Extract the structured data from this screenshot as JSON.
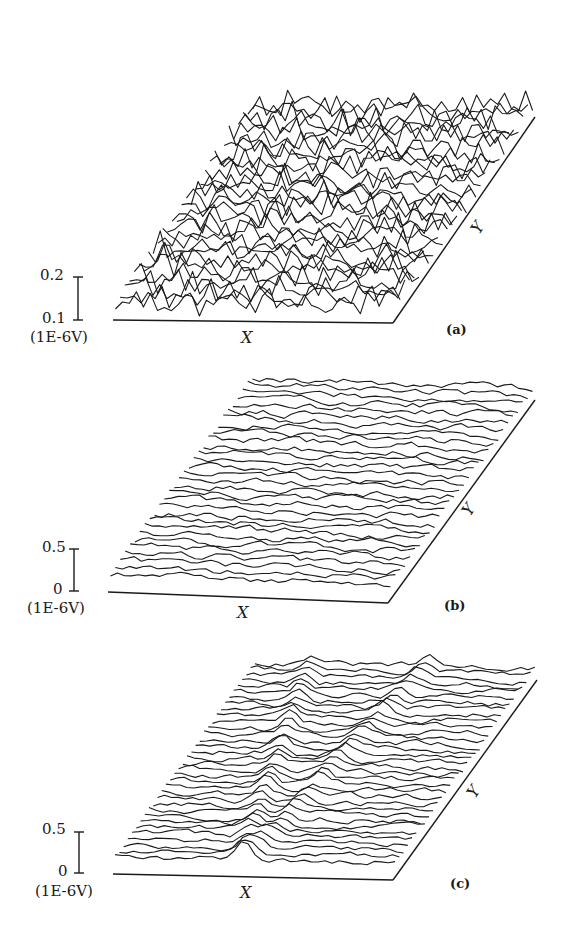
{
  "chart_data": [
    {
      "type": "surface-3d-waterfall",
      "panel": "(a)",
      "xlabel": "X",
      "ylabel": "Y",
      "zscale_bar": {
        "top_label": "0.2",
        "bottom_label": "0.1",
        "unit": "(1E-6V)"
      },
      "description": "Highly noisy, irregular surface with large random peaks across the whole X-Y plane",
      "traces": 30,
      "amplitude": 22,
      "roughness": "high",
      "seed": 7,
      "geometry": {
        "x0": 113,
        "y0": 320,
        "x1": 393,
        "y1": 323,
        "yx": 535,
        "yy": 117,
        "lift": 12
      }
    },
    {
      "type": "surface-3d-waterfall",
      "panel": "(b)",
      "xlabel": "X",
      "ylabel": "Y",
      "zscale_bar": {
        "top_label": "0.5",
        "bottom_label": "0",
        "unit": "(1E-6V)"
      },
      "description": "Low-amplitude smooth random surface; mostly flat with small ripples",
      "traces": 30,
      "amplitude": 6,
      "roughness": "low",
      "seed": 19,
      "geometry": {
        "x0": 108,
        "y0": 592,
        "x1": 388,
        "y1": 603,
        "yx": 535,
        "yy": 400,
        "lift": 12
      }
    },
    {
      "type": "surface-3d-waterfall",
      "panel": "(c)",
      "xlabel": "X",
      "ylabel": "Y",
      "zscale_bar": {
        "top_label": "0.5",
        "bottom_label": "0",
        "unit": "(1E-6V)"
      },
      "description": "Smooth surface with two distinct linear ridges running diagonally along Y",
      "traces": 34,
      "amplitude": 5,
      "roughness": "low",
      "ridges": [
        {
          "x_frac_start": 0.45,
          "x_frac_end": 0.2,
          "height": 10
        },
        {
          "x_frac_start": 0.47,
          "x_frac_end": 0.62,
          "height": 9
        }
      ],
      "seed": 31,
      "geometry": {
        "x0": 113,
        "y0": 874,
        "x1": 393,
        "y1": 880,
        "yx": 537,
        "yy": 680,
        "lift": 12
      }
    }
  ],
  "labels": {
    "a": {
      "z_top": "0.2",
      "z_bottom": "0.1",
      "unit": "(1E-6V)",
      "x": "X",
      "y": "Y",
      "id": "(a)"
    },
    "b": {
      "z_top": "0.5",
      "z_bottom": "0",
      "unit": "(1E-6V)",
      "x": "X",
      "y": "Y",
      "id": "(b)"
    },
    "c": {
      "z_top": "0.5",
      "z_bottom": "0",
      "unit": "(1E-6V)",
      "x": "X",
      "y": "Y",
      "id": "(c)"
    }
  },
  "colors": {
    "ink": "#1a1a1a",
    "background": "#ffffff"
  }
}
